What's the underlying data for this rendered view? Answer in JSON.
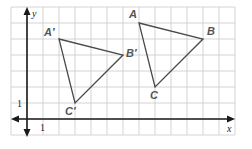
{
  "diagram": {
    "type": "coordinate-grid-translation",
    "axes": {
      "x_label": "x",
      "y_label": "y",
      "x_tick_label": "1",
      "y_tick_label": "1"
    },
    "colors": {
      "grid": "#c9c9c9",
      "axis": "#1a1a1a",
      "triangle": "#4a4a4a",
      "label": "#555555"
    },
    "triangles": [
      {
        "name": "ABC",
        "vertices": [
          {
            "label": "A",
            "x": 7,
            "y": 6
          },
          {
            "label": "B",
            "x": 11,
            "y": 5
          },
          {
            "label": "C",
            "x": 8,
            "y": 2
          }
        ]
      },
      {
        "name": "A'B'C'",
        "vertices": [
          {
            "label": "A′",
            "x": 2,
            "y": 5
          },
          {
            "label": "B′",
            "x": 6,
            "y": 4
          },
          {
            "label": "C′",
            "x": 3,
            "y": 1
          }
        ]
      }
    ]
  }
}
